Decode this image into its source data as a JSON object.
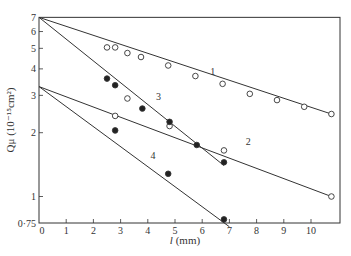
{
  "chart_data": {
    "type": "scatter",
    "title": "",
    "xlabel": "l (mm)",
    "ylabel": "Q_μ (10⁻¹⁵cm²)",
    "yscale": "log",
    "xlim": [
      0,
      11
    ],
    "ylim": [
      0.75,
      7
    ],
    "xticks": [
      0,
      1,
      2,
      3,
      4,
      5,
      6,
      7,
      8,
      9,
      10
    ],
    "yticks": [
      0.75,
      1,
      2,
      3,
      4,
      5,
      6,
      7
    ],
    "ytick_labels": [
      "0·75",
      "1",
      "2",
      "3",
      "4",
      "5",
      "6",
      "7"
    ],
    "grid": false,
    "legend": "none (curves labeled inline 1–4)",
    "series": [
      {
        "name": "1",
        "line": [
          [
            0,
            7.0
          ],
          [
            10.75,
            2.45
          ]
        ],
        "points": [
          {
            "x": 2.5,
            "y": 5.05,
            "marker": "open"
          },
          {
            "x": 2.8,
            "y": 5.05,
            "marker": "open"
          },
          {
            "x": 3.25,
            "y": 4.75,
            "marker": "open"
          },
          {
            "x": 3.75,
            "y": 4.55,
            "marker": "open"
          },
          {
            "x": 4.75,
            "y": 4.15,
            "marker": "open"
          },
          {
            "x": 5.75,
            "y": 3.7,
            "marker": "open"
          },
          {
            "x": 6.75,
            "y": 3.4,
            "marker": "open"
          },
          {
            "x": 7.75,
            "y": 3.05,
            "marker": "open"
          },
          {
            "x": 8.75,
            "y": 2.85,
            "marker": "open"
          },
          {
            "x": 9.75,
            "y": 2.65,
            "marker": "open"
          },
          {
            "x": 10.75,
            "y": 2.45,
            "marker": "open"
          }
        ]
      },
      {
        "name": "2",
        "line": [
          [
            0,
            3.3
          ],
          [
            10.75,
            1.0
          ]
        ],
        "points": [
          {
            "x": 2.8,
            "y": 2.4,
            "marker": "open"
          },
          {
            "x": 4.8,
            "y": 2.15,
            "marker": "open"
          },
          {
            "x": 6.8,
            "y": 1.65,
            "marker": "open"
          },
          {
            "x": 10.75,
            "y": 1.0,
            "marker": "open"
          }
        ]
      },
      {
        "name": "3",
        "line": [
          [
            0,
            7.0
          ],
          [
            6.8,
            1.4
          ]
        ],
        "points": [
          {
            "x": 2.5,
            "y": 3.6,
            "marker": "filled"
          },
          {
            "x": 2.8,
            "y": 3.35,
            "marker": "filled"
          },
          {
            "x": 3.25,
            "y": 2.9,
            "marker": "open"
          },
          {
            "x": 3.8,
            "y": 2.6,
            "marker": "filled"
          },
          {
            "x": 4.8,
            "y": 2.25,
            "marker": "filled"
          },
          {
            "x": 5.8,
            "y": 1.75,
            "marker": "filled"
          },
          {
            "x": 6.8,
            "y": 1.45,
            "marker": "filled"
          }
        ]
      },
      {
        "name": "4",
        "line": [
          [
            0,
            3.3
          ],
          [
            7.0,
            0.72
          ]
        ],
        "points": [
          {
            "x": 2.8,
            "y": 2.05,
            "marker": "filled"
          },
          {
            "x": 4.75,
            "y": 1.28,
            "marker": "filled"
          },
          {
            "x": 6.8,
            "y": 0.78,
            "marker": "filled"
          }
        ]
      }
    ],
    "curve_labels": [
      {
        "text": "1",
        "x": 6.3,
        "y": 3.75
      },
      {
        "text": "2",
        "x": 7.6,
        "y": 1.75
      },
      {
        "text": "3",
        "x": 4.3,
        "y": 2.85
      },
      {
        "text": "4",
        "x": 4.1,
        "y": 1.5
      }
    ]
  }
}
